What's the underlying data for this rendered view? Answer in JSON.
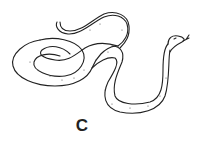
{
  "figure": {
    "label": "C",
    "colors": {
      "line": "#222222",
      "background": "#ffffff"
    }
  }
}
